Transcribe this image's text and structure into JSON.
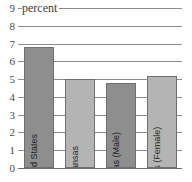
{
  "chart_data": {
    "type": "bar",
    "title": "",
    "xlabel": "",
    "ylabel": "percent",
    "unit_caption": "percent",
    "ylim": [
      0,
      9
    ],
    "yticks": [
      9,
      8,
      7,
      6,
      5,
      4,
      3,
      2,
      1,
      0
    ],
    "grid": true,
    "legend": "none",
    "categories": [
      "United States",
      "Kansas",
      "Kansas (Male)",
      "Kansas (Female)"
    ],
    "values": [
      6.8,
      5.0,
      4.8,
      5.2
    ],
    "bar_colors": [
      "#8e8e8e",
      "#b4b4b4",
      "#8e8e8e",
      "#b4b4b4"
    ]
  },
  "style": {
    "background": "#ffffff",
    "gridline_color": "#8c8c8c",
    "axis_text_color": "#4a4a4a",
    "bar_border_color": "#707070",
    "bar_dark": "#8e8e8e",
    "bar_light": "#b4b4b4"
  }
}
